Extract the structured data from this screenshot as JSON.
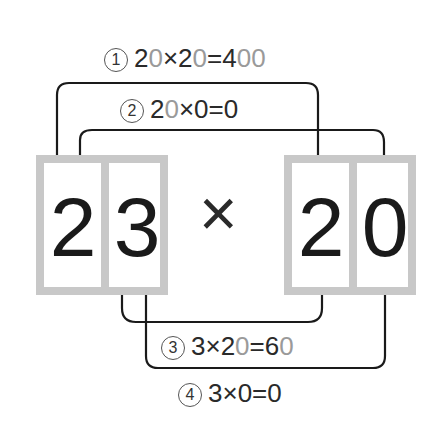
{
  "diagram": {
    "left_number": {
      "digits": [
        "2",
        "3"
      ]
    },
    "operator": "×",
    "right_number": {
      "digits": [
        "2",
        "0"
      ]
    },
    "steps": [
      {
        "marker": "1",
        "parts": [
          {
            "t": "2",
            "c": "dark"
          },
          {
            "t": "0",
            "c": "grey"
          },
          {
            "t": "×2",
            "c": "dark"
          },
          {
            "t": "0",
            "c": "grey"
          },
          {
            "t": "=4",
            "c": "dark"
          },
          {
            "t": "00",
            "c": "grey"
          }
        ],
        "text": "20×20=400"
      },
      {
        "marker": "2",
        "parts": [
          {
            "t": "2",
            "c": "dark"
          },
          {
            "t": "0",
            "c": "grey"
          },
          {
            "t": "×0=0",
            "c": "dark"
          }
        ],
        "text": "20×0=0"
      },
      {
        "marker": "3",
        "parts": [
          {
            "t": "3×2",
            "c": "dark"
          },
          {
            "t": "0",
            "c": "grey"
          },
          {
            "t": "=6",
            "c": "dark"
          },
          {
            "t": "0",
            "c": "grey"
          }
        ],
        "text": "3×20=60"
      },
      {
        "marker": "4",
        "parts": [
          {
            "t": "3×0=0",
            "c": "dark"
          }
        ],
        "text": "3×0=0"
      }
    ],
    "colors": {
      "box_border": "#c8c8c8",
      "text": "#1a1a1a",
      "muted_digit": "#9a9a9a",
      "line": "#1a1a1a"
    }
  }
}
